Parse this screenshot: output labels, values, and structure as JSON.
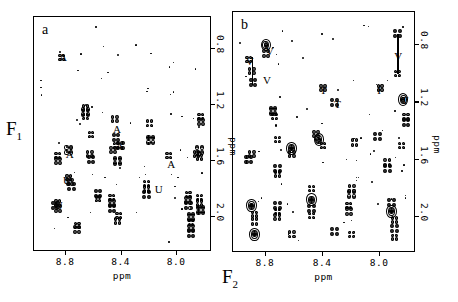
{
  "figure": {
    "axis_labels": {
      "f1": "F",
      "f1_sub": "1",
      "f2": "F",
      "f2_sub": "2"
    },
    "x_axis": {
      "title": "ppm",
      "ticks": [
        "8.8",
        "8.4",
        "8.0"
      ],
      "tick_values": [
        8.8,
        8.4,
        8.0
      ],
      "range": [
        9.02,
        7.76
      ]
    },
    "y_axis": {
      "title": "ppm",
      "ticks": [
        "0.8",
        "1.2",
        "1.6",
        "2.0"
      ],
      "tick_values": [
        0.8,
        1.2,
        1.6,
        2.0
      ],
      "range": [
        0.58,
        2.24
      ]
    }
  },
  "panels": [
    {
      "tag": "a",
      "annotations": [
        {
          "text": "A",
          "x": 8.83,
          "y": 0.86
        },
        {
          "text": "A",
          "x": 8.44,
          "y": 1.38
        },
        {
          "text": "A",
          "x": 8.78,
          "y": 1.56
        },
        {
          "text": "A",
          "x": 8.42,
          "y": 1.5
        },
        {
          "text": "A",
          "x": 8.05,
          "y": 1.63
        },
        {
          "text": "U",
          "x": 8.8,
          "y": 1.74
        },
        {
          "text": "U",
          "x": 8.86,
          "y": 1.92
        },
        {
          "text": "U",
          "x": 8.14,
          "y": 1.81
        }
      ]
    },
    {
      "tag": "b",
      "annotations": [
        {
          "text": "V",
          "x": 8.92,
          "y": 0.92
        },
        {
          "text": "V",
          "x": 8.78,
          "y": 0.85
        },
        {
          "text": "V",
          "x": 8.8,
          "y": 1.05
        },
        {
          "text": "V",
          "x": 7.88,
          "y": 0.88
        },
        {
          "text": "T",
          "x": 8.4,
          "y": 1.12
        },
        {
          "text": "T",
          "x": 8.3,
          "y": 1.22
        },
        {
          "text": "T",
          "x": 7.83,
          "y": 1.19
        },
        {
          "text": "I",
          "x": 8.0,
          "y": 1.12
        }
      ]
    }
  ],
  "chart_data": {
    "type": "scatter",
    "title": "",
    "xlabel": "ppm",
    "ylabel": "ppm",
    "xlim": [
      9.02,
      7.76
    ],
    "ylim": [
      0.58,
      2.24
    ],
    "grid": false,
    "legend": "none",
    "series": [
      {
        "name": "panel-a-crosspeaks",
        "points": [
          [
            8.83,
            0.86
          ],
          [
            8.66,
            1.22
          ],
          [
            8.66,
            1.25
          ],
          [
            8.66,
            1.28
          ],
          [
            8.45,
            1.3
          ],
          [
            8.44,
            1.43
          ],
          [
            8.44,
            1.49
          ],
          [
            8.46,
            1.52
          ],
          [
            8.41,
            1.49
          ],
          [
            8.62,
            1.41
          ],
          [
            8.2,
            1.33
          ],
          [
            8.19,
            1.45
          ],
          [
            7.83,
            1.28
          ],
          [
            7.83,
            1.32
          ],
          [
            7.84,
            1.52
          ],
          [
            7.84,
            1.57
          ],
          [
            7.86,
            1.55
          ],
          [
            8.78,
            1.52
          ],
          [
            8.86,
            1.56
          ],
          [
            8.86,
            1.6
          ],
          [
            8.43,
            1.6
          ],
          [
            8.06,
            1.56
          ],
          [
            8.63,
            1.55
          ],
          [
            8.62,
            1.59
          ],
          [
            8.78,
            1.72
          ],
          [
            8.77,
            1.75
          ],
          [
            8.76,
            1.78
          ],
          [
            8.86,
            1.9
          ],
          [
            8.86,
            1.94
          ],
          [
            8.88,
            1.92
          ],
          [
            8.47,
            1.86
          ],
          [
            8.47,
            1.9
          ],
          [
            8.47,
            1.94
          ],
          [
            8.22,
            1.76
          ],
          [
            8.22,
            1.8
          ],
          [
            8.22,
            1.84
          ],
          [
            7.92,
            1.84
          ],
          [
            7.92,
            1.88
          ],
          [
            7.92,
            1.92
          ],
          [
            7.84,
            1.86
          ],
          [
            7.84,
            1.9
          ],
          [
            7.83,
            1.95
          ],
          [
            8.72,
            2.06
          ],
          [
            8.72,
            2.09
          ],
          [
            7.9,
            2.0
          ],
          [
            7.9,
            2.04
          ],
          [
            7.9,
            2.08
          ],
          [
            7.9,
            2.12
          ],
          [
            8.42,
            1.99
          ],
          [
            8.43,
            2.03
          ],
          [
            8.57,
            1.83
          ],
          [
            8.57,
            1.87
          ]
        ]
      },
      {
        "name": "panel-b-crosspeaks",
        "points": [
          [
            8.92,
            0.9
          ],
          [
            8.9,
            0.98
          ],
          [
            8.89,
            1.06
          ],
          [
            8.8,
            0.8
          ],
          [
            8.8,
            0.86
          ],
          [
            7.88,
            0.72
          ],
          [
            7.88,
            1.0
          ],
          [
            8.4,
            1.1
          ],
          [
            8.32,
            1.2
          ],
          [
            8.0,
            1.1
          ],
          [
            7.84,
            1.18
          ],
          [
            8.75,
            1.26
          ],
          [
            8.74,
            1.3
          ],
          [
            7.82,
            1.3
          ],
          [
            7.82,
            1.34
          ],
          [
            8.72,
            1.46
          ],
          [
            8.45,
            1.42
          ],
          [
            8.43,
            1.46
          ],
          [
            8.4,
            1.5
          ],
          [
            8.18,
            1.48
          ],
          [
            8.02,
            1.44
          ],
          [
            7.85,
            1.5
          ],
          [
            8.9,
            1.56
          ],
          [
            8.92,
            1.6
          ],
          [
            8.62,
            1.52
          ],
          [
            8.62,
            1.56
          ],
          [
            8.72,
            1.66
          ],
          [
            8.72,
            1.7
          ],
          [
            7.95,
            1.62
          ],
          [
            7.95,
            1.66
          ],
          [
            8.48,
            1.8
          ],
          [
            8.48,
            1.88
          ],
          [
            8.48,
            1.94
          ],
          [
            8.48,
            1.99
          ],
          [
            8.2,
            1.8
          ],
          [
            8.2,
            1.84
          ],
          [
            8.22,
            1.92
          ],
          [
            8.22,
            1.96
          ],
          [
            8.9,
            1.92
          ],
          [
            8.88,
            1.98
          ],
          [
            8.88,
            2.03
          ],
          [
            8.72,
            1.92
          ],
          [
            8.72,
            1.96
          ],
          [
            8.72,
            2.0
          ],
          [
            7.92,
            1.9
          ],
          [
            7.92,
            1.96
          ],
          [
            7.9,
            2.02
          ],
          [
            7.9,
            2.08
          ],
          [
            7.9,
            2.14
          ],
          [
            8.62,
            2.12
          ],
          [
            8.32,
            2.1
          ],
          [
            8.2,
            2.12
          ],
          [
            8.88,
            2.12
          ]
        ]
      }
    ]
  }
}
